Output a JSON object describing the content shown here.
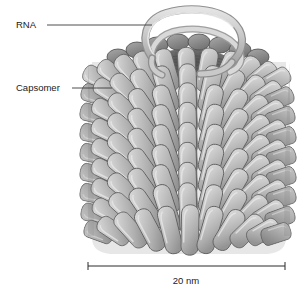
{
  "figure": {
    "background_color": "#ffffff",
    "width": 308,
    "height": 294
  },
  "labels": [
    {
      "id": "rna",
      "text": "RNA",
      "text_x": 16,
      "text_y": 25,
      "leader": {
        "x1": 47,
        "y1": 25,
        "x2": 152,
        "y2": 25
      }
    },
    {
      "id": "capsomer",
      "text": "Capsomer",
      "text_x": 16,
      "text_y": 88,
      "leader": {
        "x1": 72,
        "y1": 88,
        "x2": 112,
        "y2": 88
      }
    }
  ],
  "scale_bar": {
    "label": "20 nm",
    "x1": 88,
    "x2": 285,
    "y": 266,
    "tick_half_height": 4,
    "label_x": 186,
    "label_y": 280
  },
  "colors": {
    "capsomer_light": "#d2d2d2",
    "capsomer_mid": "#b4b4b4",
    "capsomer_shadow": "#8e8e8e",
    "capsomer_outline": "#5d5d5d",
    "cavity_dark": "#6e6e6e",
    "cavity_darkest": "#575757",
    "rna_ribbon": "#cfcfcf",
    "rna_ribbon_edge": "#8c8c8c",
    "text": "#1a1a1a",
    "leader_line": "#3a3a3a",
    "background": "#ffffff"
  },
  "virus": {
    "name": "helical-virus-cylinder",
    "cylinder": {
      "left": 88,
      "right": 290,
      "top": 55,
      "bottom": 252,
      "center_x": 189
    },
    "top_cap": {
      "center_x": 189,
      "center_y": 62,
      "rx": 100,
      "ry": 26
    },
    "central_cavity": {
      "center_x": 189,
      "center_y": 63,
      "rx": 40,
      "ry": 13
    },
    "rna_loop": {
      "description": "ribbon strand emerging from central cavity arcing above the capsid",
      "apex_y": 12
    },
    "capsomer_count_visible": 120,
    "row_count": 9
  }
}
